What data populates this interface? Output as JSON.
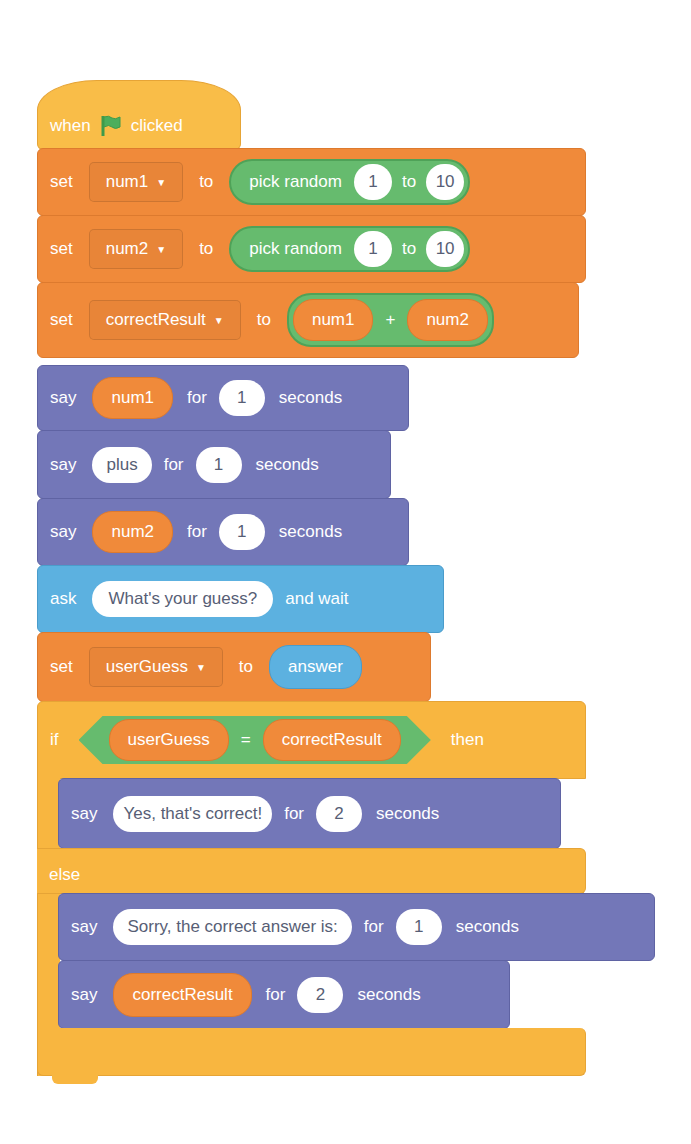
{
  "script": {
    "hat": {
      "when": "when",
      "icon": "green-flag-icon",
      "clicked": "clicked"
    },
    "set_num1": {
      "kw": "set",
      "var": "num1",
      "to": "to",
      "op": "pick random",
      "from": "1",
      "mid": "to",
      "max": "10"
    },
    "set_num2": {
      "kw": "set",
      "var": "num2",
      "to": "to",
      "op": "pick random",
      "from": "1",
      "mid": "to",
      "max": "10"
    },
    "set_result": {
      "kw": "set",
      "var": "correctResult",
      "to": "to",
      "left": "num1",
      "op": "+",
      "right": "num2"
    },
    "say1": {
      "kw": "say",
      "value": "num1",
      "for": "for",
      "secs": "1",
      "unit": "seconds"
    },
    "say2": {
      "kw": "say",
      "value": "plus",
      "for": "for",
      "secs": "1",
      "unit": "seconds"
    },
    "say3": {
      "kw": "say",
      "value": "num2",
      "for": "for",
      "secs": "1",
      "unit": "seconds"
    },
    "ask": {
      "kw": "ask",
      "question": "What's your guess?",
      "tail": "and wait"
    },
    "set_guess": {
      "kw": "set",
      "var": "userGuess",
      "to": "to",
      "value": "answer"
    },
    "if_block": {
      "kw": "if",
      "left": "userGuess",
      "op": "=",
      "right": "correctResult",
      "then": "then",
      "else": "else"
    },
    "say_yes": {
      "kw": "say",
      "value": "Yes, that's correct!",
      "for": "for",
      "secs": "2",
      "unit": "seconds"
    },
    "say_sorry": {
      "kw": "say",
      "value": "Sorry, the correct answer is:",
      "for": "for",
      "secs": "1",
      "unit": "seconds"
    },
    "say_result": {
      "kw": "say",
      "value": "correctResult",
      "for": "for",
      "secs": "2",
      "unit": "seconds"
    }
  },
  "colors": {
    "events": "#f9bd48",
    "variables": "#f08a3a",
    "operators": "#66bb6e",
    "looks": "#7377b8",
    "sensing": "#5cb1e0",
    "control": "#f8b640",
    "text": "#ffffff",
    "input_text": "#575e75"
  }
}
